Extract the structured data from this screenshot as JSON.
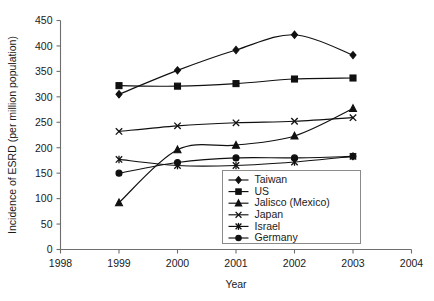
{
  "chart_data": {
    "type": "line",
    "title": "",
    "xlabel": "Year",
    "ylabel": "Incidence of ESRD (per million population)",
    "xlim": [
      1998,
      2004
    ],
    "ylim": [
      0,
      450
    ],
    "xticks": [
      "1998",
      "1999",
      "2000",
      "2001",
      "2002",
      "2003",
      "2004"
    ],
    "yticks": [
      "0",
      "50",
      "100",
      "150",
      "200",
      "250",
      "300",
      "350",
      "400",
      "450"
    ],
    "grid": false,
    "legend_position": "bottom-right",
    "x": [
      1999,
      2000,
      2001,
      2002,
      2003
    ],
    "series": [
      {
        "name": "Taiwan",
        "marker": "diamond",
        "values": [
          305,
          352,
          392,
          422,
          382
        ]
      },
      {
        "name": "US",
        "marker": "square",
        "values": [
          322,
          321,
          326,
          335,
          337
        ]
      },
      {
        "name": "Jalisco (Mexico)",
        "marker": "triangle",
        "values": [
          92,
          196,
          205,
          223,
          277
        ]
      },
      {
        "name": "Japan",
        "marker": "cross",
        "values": [
          232,
          243,
          249,
          252,
          259
        ]
      },
      {
        "name": "Israel",
        "marker": "asterisk",
        "values": [
          177,
          165,
          165,
          172,
          183
        ]
      },
      {
        "name": "Germany",
        "marker": "circle",
        "values": [
          150,
          171,
          180,
          180,
          183
        ]
      }
    ]
  },
  "legend": {
    "entries": [
      {
        "label": "Taiwan"
      },
      {
        "label": "US"
      },
      {
        "label": "Jalisco (Mexico)"
      },
      {
        "label": "Japan"
      },
      {
        "label": "Israel"
      },
      {
        "label": "Germany"
      }
    ]
  },
  "axes": {
    "y_title": "Incidence of ESRD (per million population)",
    "x_title": "Year"
  }
}
